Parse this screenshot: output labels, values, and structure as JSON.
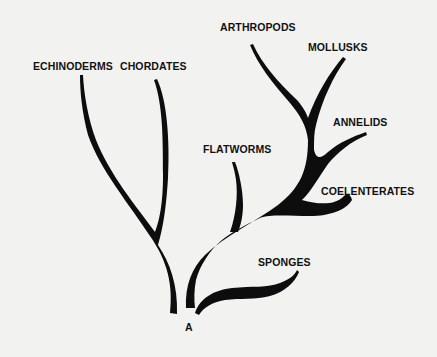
{
  "diagram": {
    "type": "phylogenetic-tree",
    "root_label": "A",
    "taxa": [
      {
        "id": "echinoderms",
        "label": "ECHINODERMS"
      },
      {
        "id": "chordates",
        "label": "CHORDATES"
      },
      {
        "id": "arthropods",
        "label": "ARTHROPODS"
      },
      {
        "id": "mollusks",
        "label": "MOLLUSKS"
      },
      {
        "id": "annelids",
        "label": "ANNELIDS"
      },
      {
        "id": "flatworms",
        "label": "FLATWORMS"
      },
      {
        "id": "coelenterates",
        "label": "COELENTERATES"
      },
      {
        "id": "sponges",
        "label": "SPONGES"
      }
    ],
    "colors": {
      "branch": "#0d0d0d",
      "background": "#f2f2f0",
      "text": "#111111"
    }
  }
}
